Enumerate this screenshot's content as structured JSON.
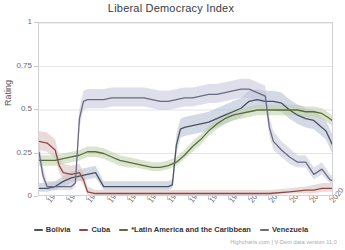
{
  "chart_data": {
    "type": "line",
    "title": "Liberal Democracy Index",
    "xlabel": "",
    "ylabel": "Rating",
    "xlim": [
      1948,
      2021
    ],
    "ylim": [
      0,
      1
    ],
    "grid": true,
    "legend_position": "bottom",
    "yticks": [
      "0",
      "0.25",
      "0.5",
      "0.75",
      "1"
    ],
    "ytick_values": [
      0,
      0.25,
      0.5,
      0.75,
      1
    ],
    "xticks": [
      "1950",
      "1955",
      "1960",
      "1965",
      "1970",
      "1975",
      "1980",
      "1985",
      "1990",
      "1995",
      "2000",
      "2005",
      "2010",
      "2015",
      "2020"
    ],
    "xtick_values": [
      1950,
      1955,
      1960,
      1965,
      1970,
      1975,
      1980,
      1985,
      1990,
      1995,
      2000,
      2005,
      2010,
      2015,
      2020
    ],
    "confidence_bands": true,
    "series": [
      {
        "name": "Bolivia",
        "color": "#4a5160",
        "band_color": "#aebcd2",
        "x": [
          1948,
          1950,
          1952,
          1954,
          1956,
          1958,
          1960,
          1962,
          1964,
          1966,
          1968,
          1970,
          1972,
          1974,
          1976,
          1978,
          1980,
          1981,
          1982,
          1983,
          1984,
          1986,
          1988,
          1990,
          1992,
          1994,
          1996,
          1998,
          2000,
          2002,
          2004,
          2006,
          2008,
          2010,
          2012,
          2014,
          2016,
          2018,
          2019,
          2020,
          2021
        ],
        "values": [
          0.05,
          0.05,
          0.06,
          0.09,
          0.11,
          0.12,
          0.13,
          0.14,
          0.06,
          0.06,
          0.06,
          0.06,
          0.06,
          0.06,
          0.06,
          0.06,
          0.06,
          0.07,
          0.3,
          0.39,
          0.4,
          0.41,
          0.42,
          0.43,
          0.45,
          0.47,
          0.49,
          0.51,
          0.55,
          0.56,
          0.55,
          0.55,
          0.54,
          0.5,
          0.47,
          0.45,
          0.44,
          0.4,
          0.38,
          0.33,
          0.28
        ],
        "band_low": [
          0.03,
          0.03,
          0.04,
          0.06,
          0.08,
          0.09,
          0.1,
          0.11,
          0.04,
          0.04,
          0.04,
          0.04,
          0.04,
          0.04,
          0.04,
          0.04,
          0.04,
          0.05,
          0.25,
          0.34,
          0.35,
          0.36,
          0.37,
          0.38,
          0.4,
          0.42,
          0.44,
          0.46,
          0.5,
          0.51,
          0.5,
          0.5,
          0.49,
          0.45,
          0.42,
          0.4,
          0.39,
          0.35,
          0.33,
          0.28,
          0.23
        ],
        "band_high": [
          0.08,
          0.08,
          0.09,
          0.12,
          0.15,
          0.16,
          0.17,
          0.18,
          0.09,
          0.09,
          0.09,
          0.09,
          0.09,
          0.09,
          0.09,
          0.09,
          0.09,
          0.1,
          0.36,
          0.45,
          0.46,
          0.47,
          0.48,
          0.49,
          0.51,
          0.53,
          0.55,
          0.57,
          0.61,
          0.62,
          0.61,
          0.61,
          0.6,
          0.56,
          0.53,
          0.51,
          0.5,
          0.46,
          0.44,
          0.39,
          0.34
        ]
      },
      {
        "name": "Cuba",
        "color": "#8c4a47",
        "band_color": "#d9bdbb",
        "x": [
          1948,
          1950,
          1952,
          1953,
          1954,
          1956,
          1958,
          1959,
          1960,
          1962,
          1966,
          1970,
          1975,
          1980,
          1985,
          1990,
          1995,
          2000,
          2005,
          2010,
          2014,
          2016,
          2018,
          2020,
          2021
        ],
        "values": [
          0.32,
          0.31,
          0.27,
          0.18,
          0.14,
          0.13,
          0.14,
          0.1,
          0.03,
          0.02,
          0.02,
          0.02,
          0.02,
          0.02,
          0.02,
          0.02,
          0.02,
          0.02,
          0.02,
          0.03,
          0.04,
          0.04,
          0.05,
          0.05,
          0.05
        ],
        "band_low": [
          0.27,
          0.26,
          0.22,
          0.14,
          0.1,
          0.09,
          0.1,
          0.07,
          0.01,
          0.01,
          0.01,
          0.01,
          0.01,
          0.01,
          0.01,
          0.01,
          0.01,
          0.01,
          0.01,
          0.02,
          0.02,
          0.02,
          0.03,
          0.03,
          0.03
        ],
        "band_high": [
          0.38,
          0.37,
          0.33,
          0.23,
          0.19,
          0.18,
          0.19,
          0.14,
          0.06,
          0.04,
          0.04,
          0.04,
          0.04,
          0.04,
          0.04,
          0.04,
          0.04,
          0.04,
          0.04,
          0.05,
          0.06,
          0.07,
          0.08,
          0.08,
          0.08
        ]
      },
      {
        "name": "*Latin America and the Caribbean",
        "color": "#5d6b3a",
        "band_color": "#bcd0a8",
        "x": [
          1948,
          1950,
          1952,
          1954,
          1956,
          1958,
          1960,
          1962,
          1964,
          1966,
          1968,
          1970,
          1972,
          1974,
          1976,
          1978,
          1980,
          1982,
          1984,
          1986,
          1988,
          1990,
          1992,
          1994,
          1996,
          1998,
          2000,
          2002,
          2004,
          2006,
          2008,
          2010,
          2012,
          2014,
          2016,
          2018,
          2020,
          2021
        ],
        "values": [
          0.21,
          0.21,
          0.21,
          0.22,
          0.23,
          0.24,
          0.26,
          0.26,
          0.25,
          0.23,
          0.21,
          0.2,
          0.19,
          0.18,
          0.17,
          0.17,
          0.18,
          0.2,
          0.24,
          0.29,
          0.33,
          0.38,
          0.42,
          0.45,
          0.47,
          0.48,
          0.49,
          0.5,
          0.5,
          0.5,
          0.5,
          0.5,
          0.5,
          0.49,
          0.49,
          0.48,
          0.45,
          0.43
        ],
        "band_low": [
          0.18,
          0.18,
          0.18,
          0.19,
          0.2,
          0.21,
          0.23,
          0.23,
          0.22,
          0.2,
          0.18,
          0.17,
          0.17,
          0.16,
          0.15,
          0.15,
          0.16,
          0.18,
          0.22,
          0.26,
          0.3,
          0.35,
          0.39,
          0.42,
          0.44,
          0.45,
          0.46,
          0.47,
          0.47,
          0.47,
          0.47,
          0.47,
          0.47,
          0.46,
          0.46,
          0.45,
          0.42,
          0.4
        ],
        "band_high": [
          0.24,
          0.24,
          0.24,
          0.25,
          0.26,
          0.27,
          0.29,
          0.29,
          0.28,
          0.26,
          0.24,
          0.23,
          0.22,
          0.21,
          0.2,
          0.2,
          0.21,
          0.23,
          0.27,
          0.32,
          0.36,
          0.41,
          0.45,
          0.48,
          0.5,
          0.51,
          0.52,
          0.53,
          0.53,
          0.53,
          0.53,
          0.53,
          0.53,
          0.52,
          0.52,
          0.51,
          0.48,
          0.46
        ]
      },
      {
        "name": "Venezuela",
        "color": "#6a6a80",
        "band_color": "#c4c4dc",
        "x": [
          1948,
          1949,
          1950,
          1952,
          1954,
          1956,
          1957,
          1958,
          1959,
          1960,
          1962,
          1964,
          1966,
          1968,
          1970,
          1972,
          1974,
          1976,
          1978,
          1980,
          1982,
          1984,
          1986,
          1988,
          1990,
          1992,
          1994,
          1996,
          1998,
          2000,
          2002,
          2004,
          2005,
          2006,
          2008,
          2010,
          2012,
          2014,
          2016,
          2018,
          2020,
          2021
        ],
        "values": [
          0.26,
          0.12,
          0.06,
          0.06,
          0.06,
          0.06,
          0.08,
          0.45,
          0.55,
          0.56,
          0.56,
          0.56,
          0.57,
          0.57,
          0.57,
          0.57,
          0.57,
          0.56,
          0.55,
          0.55,
          0.56,
          0.57,
          0.57,
          0.58,
          0.59,
          0.59,
          0.6,
          0.61,
          0.62,
          0.62,
          0.6,
          0.58,
          0.4,
          0.32,
          0.27,
          0.23,
          0.2,
          0.2,
          0.13,
          0.16,
          0.1,
          0.09
        ],
        "band_low": [
          0.21,
          0.09,
          0.04,
          0.04,
          0.04,
          0.04,
          0.06,
          0.4,
          0.5,
          0.51,
          0.51,
          0.51,
          0.52,
          0.52,
          0.52,
          0.52,
          0.52,
          0.51,
          0.5,
          0.5,
          0.51,
          0.52,
          0.52,
          0.53,
          0.54,
          0.54,
          0.55,
          0.56,
          0.57,
          0.57,
          0.55,
          0.53,
          0.35,
          0.27,
          0.23,
          0.19,
          0.17,
          0.17,
          0.1,
          0.13,
          0.08,
          0.07
        ],
        "band_high": [
          0.32,
          0.17,
          0.09,
          0.09,
          0.09,
          0.09,
          0.12,
          0.51,
          0.61,
          0.62,
          0.62,
          0.62,
          0.63,
          0.63,
          0.63,
          0.63,
          0.63,
          0.62,
          0.61,
          0.61,
          0.62,
          0.63,
          0.63,
          0.64,
          0.65,
          0.65,
          0.66,
          0.67,
          0.68,
          0.68,
          0.66,
          0.64,
          0.46,
          0.38,
          0.32,
          0.28,
          0.24,
          0.24,
          0.17,
          0.2,
          0.13,
          0.12
        ]
      }
    ]
  },
  "credits": "Highcharts.com | V-Dem data version 11.0"
}
